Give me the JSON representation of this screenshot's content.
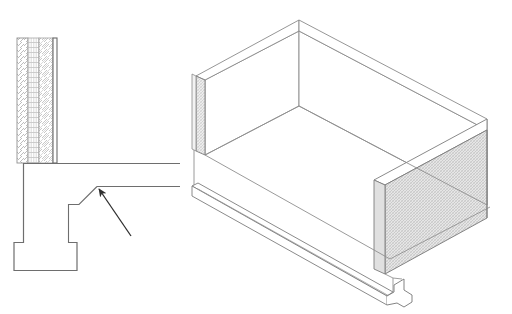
{
  "document": {
    "title": "Construction detail drawing",
    "background_color": "#ffffff",
    "width": 512,
    "height": 314,
    "line_color": "#6e6e6e",
    "line_color_dark": "#3a3a3a",
    "hatch_color": "#b8b8b8",
    "fill_light": "#ffffff",
    "fill_shaded": "#d8d8d8"
  },
  "views": {
    "section": {
      "name": "section-detail-view",
      "label": "Wall section detail",
      "elements": {
        "wall": {
          "name": "layered-wall-assembly",
          "x": 17,
          "y": 38,
          "width": 40,
          "height": 125,
          "layers": [
            {
              "name": "outer-leaf",
              "pattern": "diagonal-hatch",
              "x": 17,
              "width": 11
            },
            {
              "name": "cavity-insulation",
              "pattern": "grid-hatch",
              "x": 28,
              "width": 11
            },
            {
              "name": "inner-leaf",
              "pattern": "cross-hatch",
              "x": 39,
              "width": 14
            },
            {
              "name": "inner-lining",
              "pattern": "solid-line",
              "x": 53,
              "width": 4
            }
          ]
        },
        "column": {
          "name": "column-stem",
          "x": 23,
          "y": 163,
          "width": 9,
          "height": 79
        },
        "footing": {
          "name": "column-footing",
          "x": 23,
          "y": 242,
          "width": 54,
          "height": 28
        },
        "upstand": {
          "name": "upstand-return",
          "x": 68,
          "y": 204,
          "width": 9,
          "height": 38
        },
        "slab_line_upper": {
          "name": "slab-soffit-line-upper",
          "x1": 23,
          "y1": 163,
          "x2": 180,
          "y2": 163
        },
        "slab_line_lower": {
          "name": "slab-soffit-line-lower",
          "x1": 97,
          "y1": 186,
          "x2": 180,
          "y2": 186
        },
        "leader_step": {
          "name": "leader-step-line",
          "points": "68,204 79,204 97,186"
        },
        "arrow": {
          "name": "annotation-arrow",
          "tail_x": 131,
          "tail_y": 236,
          "head_x": 96,
          "head_y": 187
        }
      }
    },
    "isometric": {
      "name": "isometric-view",
      "label": "Isometric of precast unit",
      "elements": {
        "back_left_wall": {
          "name": "back-left-wall-panel",
          "shaded": false
        },
        "back_right_wall": {
          "name": "back-right-wall-panel",
          "shaded": false
        },
        "left_end_cap": {
          "name": "left-end-cap-face",
          "pattern": "fine-cross-hatch"
        },
        "right_end_cap": {
          "name": "right-end-wall-face",
          "pattern": "fine-cross-hatch"
        },
        "floor_slab": {
          "name": "floor-slab-surface",
          "shaded": false
        },
        "base_plinth": {
          "name": "base-plinth-edge",
          "shaded": false
        },
        "notch": {
          "name": "plinth-notch-detail",
          "shaded": false
        }
      }
    }
  }
}
